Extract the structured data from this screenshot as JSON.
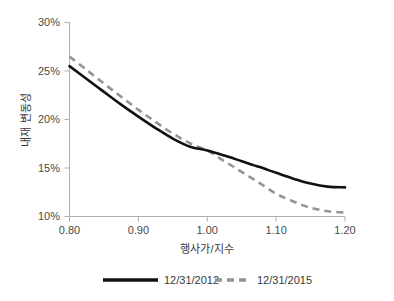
{
  "chart_data": {
    "type": "line",
    "title": "",
    "xlabel": "행사가/지수",
    "ylabel": "내재 변동성",
    "xlim": [
      0.8,
      1.2
    ],
    "ylim": [
      0.1,
      0.3
    ],
    "grid": false,
    "legend_position": "bottom",
    "x_ticks": [
      "0.80",
      "0.90",
      "1.00",
      "1.10",
      "1.20"
    ],
    "x_tick_values": [
      0.8,
      0.9,
      1.0,
      1.1,
      1.2
    ],
    "y_ticks": [
      "10%",
      "15%",
      "20%",
      "25%",
      "30%"
    ],
    "y_tick_values": [
      0.1,
      0.15,
      0.2,
      0.25,
      0.3
    ],
    "x": [
      0.8,
      0.825,
      0.85,
      0.875,
      0.9,
      0.925,
      0.95,
      0.975,
      1.0,
      1.025,
      1.05,
      1.075,
      1.1,
      1.125,
      1.15,
      1.175,
      1.2
    ],
    "series": [
      {
        "name": "12/31/2012",
        "style": "solid",
        "color": "#111111",
        "values": [
          0.255,
          0.2418,
          0.2285,
          0.2153,
          0.203,
          0.1912,
          0.1803,
          0.172,
          0.168,
          0.1628,
          0.157,
          0.1512,
          0.145,
          0.139,
          0.134,
          0.1308,
          0.13
        ]
      },
      {
        "name": "12/31/2015",
        "style": "dashed",
        "color": "#949494",
        "values": [
          0.265,
          0.251,
          0.237,
          0.2235,
          0.21,
          0.1975,
          0.1855,
          0.1755,
          0.168,
          0.157,
          0.146,
          0.135,
          0.1235,
          0.1155,
          0.109,
          0.1055,
          0.104
        ]
      }
    ]
  },
  "legend": {
    "entries": [
      {
        "label": "12/31/2012"
      },
      {
        "label": "12/31/2015"
      }
    ]
  }
}
